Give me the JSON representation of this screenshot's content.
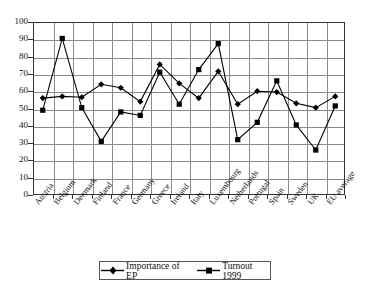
{
  "chart_data": {
    "type": "line",
    "title": "",
    "xlabel": "",
    "ylabel": "",
    "ylim": [
      0,
      100
    ],
    "ytick_step": 10,
    "grid": true,
    "legend_position": "bottom",
    "categories": [
      "Austria",
      "Belgium",
      "Denmark",
      "Finland",
      "France",
      "Germany",
      "Greece",
      "Ireland",
      "Italy",
      "Luxembourg",
      "Netherlands",
      "Portugal",
      "Spain",
      "Sweden",
      "UK",
      "EU average"
    ],
    "yticks": [
      "0",
      "10",
      "20",
      "30",
      "40",
      "50",
      "60",
      "70",
      "80",
      "90",
      "100"
    ],
    "series": [
      {
        "name": "Importance of EP",
        "marker": "diamond",
        "color": "#000000",
        "values": [
          56,
          57,
          56.5,
          64,
          62,
          54,
          75.5,
          64.5,
          56,
          71.5,
          52.5,
          60,
          59.5,
          53,
          50.5,
          57
        ]
      },
      {
        "name": "Turnout 1999",
        "marker": "square",
        "color": "#000000",
        "values": [
          49,
          90.5,
          50.5,
          31,
          48,
          46,
          71,
          52.5,
          72.5,
          87.5,
          32,
          42,
          66,
          40.5,
          26,
          51.5
        ]
      }
    ]
  },
  "legend": {
    "items": [
      {
        "label": "Importance of EP",
        "marker": "diamond"
      },
      {
        "label": "Turnout 1999",
        "marker": "square"
      }
    ]
  }
}
